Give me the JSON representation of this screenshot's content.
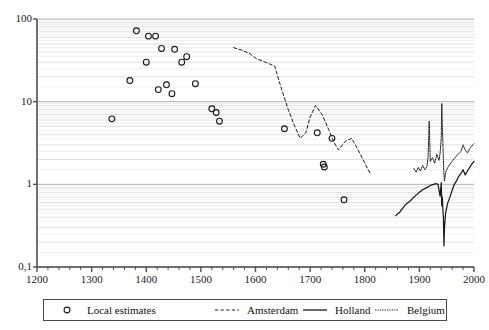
{
  "chart_data": {
    "type": "line",
    "title": "",
    "subtitle": "",
    "xlabel": "",
    "ylabel": "",
    "xscale": "linear",
    "yscale": "log",
    "xlim": [
      1200,
      2000
    ],
    "ylim": [
      0.1,
      100
    ],
    "grid": true,
    "grid_axis": "y",
    "grid_minor": true,
    "legend_position": "bottom",
    "x_ticks": [
      1200,
      1300,
      1400,
      1500,
      1600,
      1700,
      1800,
      1900,
      2000
    ],
    "x_tick_labels": [
      "1200",
      "1300",
      "1400",
      "1500",
      "1600",
      "1700",
      "1800",
      "1900",
      "2000"
    ],
    "x_minor_tick_step": 20,
    "y_ticks": [
      0.1,
      1,
      10,
      100
    ],
    "y_tick_labels": [
      "0,1",
      "1",
      "10",
      "100"
    ],
    "series": [
      {
        "name": "Local estimates",
        "style": "scatter",
        "marker": "open-circle",
        "color": "#1a1a1a",
        "points": [
          [
            1337,
            6.2
          ],
          [
            1370,
            18.0
          ],
          [
            1382,
            72.0
          ],
          [
            1400,
            30.0
          ],
          [
            1404,
            62.0
          ],
          [
            1417,
            62.0
          ],
          [
            1422,
            14.0
          ],
          [
            1428,
            44.0
          ],
          [
            1437,
            16.0
          ],
          [
            1447,
            12.5
          ],
          [
            1452,
            43.0
          ],
          [
            1465,
            30.0
          ],
          [
            1474,
            35.0
          ],
          [
            1490,
            16.5
          ],
          [
            1520,
            8.2
          ],
          [
            1528,
            7.4
          ],
          [
            1534,
            5.8
          ],
          [
            1653,
            4.7
          ],
          [
            1713,
            4.2
          ],
          [
            1740,
            3.6
          ],
          [
            1724,
            1.75
          ],
          [
            1726,
            1.62
          ],
          [
            1762,
            0.65
          ]
        ]
      },
      {
        "name": "Amsterdam",
        "style": "dashed",
        "color": "#1a1a1a",
        "x": [
          1560,
          1575,
          1590,
          1602,
          1618,
          1635,
          1648,
          1660,
          1672,
          1682,
          1692,
          1700,
          1710,
          1722,
          1734,
          1744,
          1752,
          1764,
          1776,
          1788,
          1800,
          1810
        ],
        "values": [
          45.0,
          42.0,
          38.0,
          33.0,
          30.0,
          27.0,
          14.0,
          8.0,
          5.0,
          3.6,
          4.2,
          6.5,
          9.0,
          7.0,
          4.6,
          3.2,
          2.6,
          3.3,
          3.6,
          2.6,
          1.8,
          1.35
        ]
      },
      {
        "name": "Holland",
        "style": "solid",
        "color": "#1a1a1a",
        "x": [
          1857,
          1864,
          1870,
          1876,
          1882,
          1888,
          1894,
          1900,
          1906,
          1912,
          1918,
          1922,
          1926,
          1930,
          1934,
          1938,
          1940,
          1941,
          1942,
          1943,
          1944,
          1945,
          1946,
          1948,
          1952,
          1956,
          1960,
          1964,
          1968,
          1972,
          1976,
          1980,
          1984,
          1988,
          1992,
          1996,
          2000
        ],
        "values": [
          0.42,
          0.46,
          0.52,
          0.58,
          0.62,
          0.68,
          0.74,
          0.8,
          0.86,
          0.9,
          0.95,
          0.98,
          1.0,
          1.02,
          1.0,
          0.72,
          1.05,
          0.55,
          0.7,
          0.5,
          0.4,
          0.18,
          0.3,
          0.45,
          0.6,
          0.7,
          0.85,
          1.0,
          1.1,
          1.25,
          1.35,
          1.5,
          1.3,
          1.45,
          1.6,
          1.75,
          1.9
        ]
      },
      {
        "name": "Belgium",
        "style": "dotted",
        "color": "#1a1a1a",
        "x": [
          1890,
          1894,
          1898,
          1902,
          1906,
          1910,
          1914,
          1916,
          1918,
          1920,
          1924,
          1928,
          1932,
          1936,
          1938,
          1940,
          1941,
          1942,
          1943,
          1944,
          1945,
          1946,
          1948,
          1952,
          1956,
          1960,
          1964,
          1968,
          1972,
          1976,
          1980,
          1984,
          1988,
          1992,
          1996,
          2000
        ],
        "values": [
          1.55,
          1.4,
          1.6,
          1.45,
          1.7,
          1.5,
          1.65,
          2.2,
          5.8,
          1.9,
          2.1,
          1.8,
          2.3,
          1.95,
          2.4,
          3.6,
          9.5,
          5.0,
          3.2,
          2.0,
          1.3,
          1.1,
          1.4,
          1.6,
          1.75,
          1.9,
          2.05,
          2.2,
          2.35,
          2.5,
          3.0,
          2.6,
          2.4,
          2.7,
          2.9,
          3.1
        ]
      }
    ]
  },
  "legend": {
    "items": [
      {
        "label": "Local estimates",
        "key": "open-circle"
      },
      {
        "label": "Amsterdam",
        "key": "dashed-line"
      },
      {
        "label": "Holland",
        "key": "solid-line"
      },
      {
        "label": "Belgium",
        "key": "dotted-line"
      }
    ]
  }
}
